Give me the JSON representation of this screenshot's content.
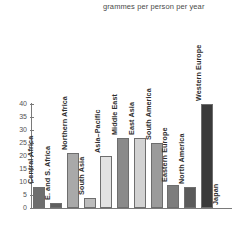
{
  "chart_title": "grammes per person per year",
  "yaxis": {
    "ticks": [
      "40",
      "35",
      "30",
      "25",
      "20",
      "15",
      "10",
      "5",
      "0"
    ]
  },
  "chart_data": {
    "type": "bar",
    "title": "grammes per person per year",
    "subtitle": "",
    "xlabel": "",
    "ylabel": "grammes per person per year",
    "ylim": [
      0,
      40
    ],
    "ytick_step": 5,
    "grid": false,
    "legend": "none",
    "orientation": "vertical",
    "categories": [
      "Central Africa",
      "E. and S. Africa",
      "Northern Africa",
      "South Asia",
      "Asia–Pacific",
      "Middle East",
      "East Asia",
      "South America",
      "Eastern Europe",
      "North America",
      "Western Europe",
      "Japan"
    ],
    "values": [
      8,
      2,
      21,
      4,
      20,
      27,
      27,
      25,
      9,
      8,
      40,
      0
    ],
    "bar_colors": [
      "#6e6e6e",
      "#5f5f5f",
      "#a9a9a9",
      "#bcbcbc",
      "#e2e2e2",
      "#8a8a8a",
      "#d2d2d2",
      "#9b9b9b",
      "#7d7d7d",
      "#5a5a5a",
      "#3a3a3a",
      "#ffffff"
    ]
  },
  "colors": {
    "axis": "#7a7a7a",
    "tick_text": "#555555",
    "label_text": "#2e2e2e",
    "title_text": "#4a4a4a",
    "background": "#ffffff"
  }
}
